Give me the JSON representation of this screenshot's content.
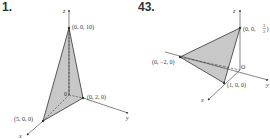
{
  "figures": [
    {
      "number": "1.",
      "axes": {
        "x": "x",
        "y": "y",
        "z": "z"
      },
      "origin": "0",
      "points": [
        "(0, 0, 10)",
        "(0, 2, 0)",
        "(5, 0, 0)"
      ]
    },
    {
      "number": "43.",
      "axes": {
        "x": "x",
        "y": "y",
        "z": "z"
      },
      "origin": "O",
      "points": [
        "(0, 0, 3/2)",
        "(0, −2, 0)",
        "(1, 0, 0)"
      ],
      "frac_num": "3",
      "frac_den": "2",
      "z_point_prefix": "(0, 0, ",
      "z_point_suffix": ")"
    }
  ],
  "colors": {
    "shade": "#c8c8c8",
    "stroke": "#333333"
  }
}
